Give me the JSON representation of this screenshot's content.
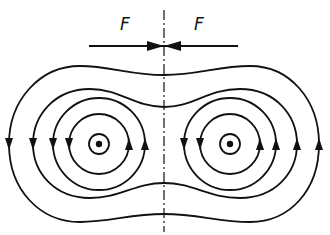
{
  "figure": {
    "type": "magnetic field line diagram",
    "labels": {
      "force_left": "F",
      "force_right": "F"
    },
    "conductors": [
      {
        "name": "left-conductor",
        "current_direction": "out-of-page"
      },
      {
        "name": "right-conductor",
        "current_direction": "out-of-page"
      }
    ],
    "field_line_direction": "counterclockwise",
    "individual_loops_per_conductor": 2,
    "enclosing_loops": 2,
    "colors": {
      "line": "#111111",
      "background": "#ffffff"
    }
  }
}
